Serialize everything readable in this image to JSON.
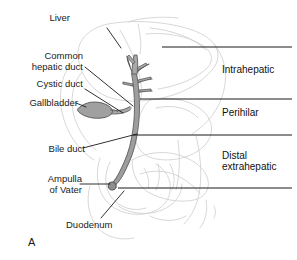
{
  "figure": {
    "panel_letter": "A",
    "background_color": "#ffffff",
    "duct_fill_color": "#a8a8a8",
    "duct_stroke_color": "#4a4a4a",
    "organ_outline_color": "#d0d0d0",
    "leader_line_color": "#1a1a1a",
    "divider_line_color": "#1a1a1a",
    "text_color": "#1a1a1a"
  },
  "anatomy_labels": [
    {
      "id": "liver",
      "text": "Liver",
      "x": 72,
      "y": 18,
      "align": "left"
    },
    {
      "id": "common-hepatic-duct",
      "text": "Common\nhepatic duct",
      "x": 20,
      "y": 55,
      "align": "right"
    },
    {
      "id": "cystic-duct",
      "text": "Cystic duct",
      "x": 30,
      "y": 83,
      "align": "right"
    },
    {
      "id": "gallbladder",
      "text": "Gallbladder",
      "x": 16,
      "y": 101,
      "align": "right"
    },
    {
      "id": "bile-duct",
      "text": "Bile duct",
      "x": 31,
      "y": 145,
      "align": "right"
    },
    {
      "id": "ampulla-of-vater",
      "text": "Ampulla\nof Vater",
      "x": 33,
      "y": 177,
      "align": "right"
    },
    {
      "id": "duodenum",
      "text": "Duodenum",
      "x": 66,
      "y": 224,
      "align": "left"
    }
  ],
  "region_labels": [
    {
      "id": "intrahepatic",
      "text": "Intrahepatic",
      "x": 222,
      "y": 68
    },
    {
      "id": "perihilar",
      "text": "Perihilar",
      "x": 222,
      "y": 111
    },
    {
      "id": "distal-extrahepatic",
      "text": "Distal\nextrahepatic",
      "x": 222,
      "y": 155
    }
  ],
  "divider_lines": [
    {
      "id": "divider-top",
      "x1": 162,
      "y1": 47,
      "x2": 292,
      "y2": 47
    },
    {
      "id": "divider-intrahepatic-perihilar",
      "x1": 140,
      "y1": 99,
      "x2": 292,
      "y2": 99
    },
    {
      "id": "divider-perihilar-distal",
      "x1": 133,
      "y1": 135,
      "x2": 292,
      "y2": 135
    },
    {
      "id": "divider-bottom",
      "x1": 118,
      "y1": 188,
      "x2": 292,
      "y2": 188
    }
  ],
  "leader_lines": [
    {
      "id": "leader-liver",
      "points": "107,28 120,47"
    },
    {
      "id": "leader-common-hepatic-duct",
      "points": "84,67 139,112"
    },
    {
      "id": "leader-cystic-duct",
      "points": "84,88 134,118"
    },
    {
      "id": "leader-gallbladder",
      "points": "80,106 92,112"
    },
    {
      "id": "leader-bile-duct",
      "points": "82,148 138,134"
    },
    {
      "id": "leader-ampulla",
      "points": "79,183 112,180"
    },
    {
      "id": "leader-duodenum",
      "points": "101,218 123,192"
    }
  ]
}
